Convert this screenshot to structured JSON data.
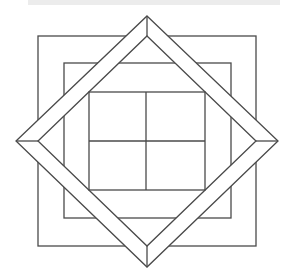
{
  "figure": {
    "title": "",
    "stroke_color": "#4a4a4a",
    "background_color": "#ffffff",
    "strip_color": "#ececec",
    "outer_square": {
      "x1": 38,
      "y1": 36,
      "x2": 256,
      "y2": 246
    },
    "inner_square": {
      "x1": 64,
      "y1": 63,
      "x2": 231,
      "y2": 218
    },
    "outer_diamond": {
      "top": [
        147,
        16
      ],
      "right": [
        278,
        141
      ],
      "bottom": [
        147,
        267
      ],
      "left": [
        16,
        141
      ]
    },
    "inner_diamond": {
      "top": [
        147,
        36
      ],
      "right": [
        256,
        141
      ],
      "bottom": [
        147,
        246
      ],
      "left": [
        38,
        141
      ]
    },
    "grid": {
      "x1": 89,
      "y1": 92,
      "x2": 205,
      "y2": 190,
      "mid_x": 146,
      "mid_y": 141,
      "rows": 2,
      "cols": 2
    }
  }
}
